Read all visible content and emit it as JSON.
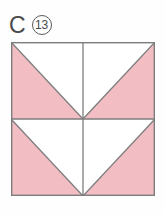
{
  "label": {
    "letter": "C",
    "number": "13",
    "badge_shape": "circle"
  },
  "block": {
    "title": "quilt-block-diagram",
    "description": "Square quilt block divided into four equal quadrants; each quadrant is a half-square triangle with one pink half and one white half, arranged so the pink regions form a chevron pointing to the block center.",
    "fill_color": "#f2bec4",
    "empty_color": "#ffffff",
    "line_color": "#7d7d7d",
    "outline_color": "#7d7d7d",
    "grid_rows": 2,
    "grid_cols": 2,
    "units": [
      {
        "name": "top-left-unit",
        "row": 0,
        "col": 0,
        "type": "half-square-triangle",
        "diagonal": "topleft-to-bottomright",
        "filled_half": "lower-left"
      },
      {
        "name": "top-right-unit",
        "row": 0,
        "col": 1,
        "type": "half-square-triangle",
        "diagonal": "topright-to-bottomleft",
        "filled_half": "lower-right"
      },
      {
        "name": "bottom-left-unit",
        "row": 1,
        "col": 0,
        "type": "half-square-triangle",
        "diagonal": "topleft-to-bottomright",
        "filled_half": "lower-left"
      },
      {
        "name": "bottom-right-unit",
        "row": 1,
        "col": 1,
        "type": "half-square-triangle",
        "diagonal": "topright-to-bottomleft",
        "filled_half": "lower-right"
      }
    ]
  },
  "page": {
    "background_color": "#fefefe"
  }
}
